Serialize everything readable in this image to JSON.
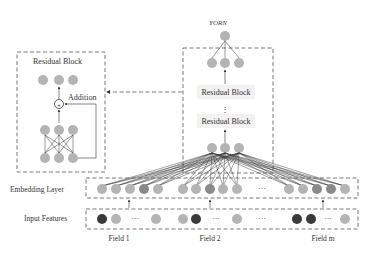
{
  "diagram": {
    "output_label": "y_ORN",
    "output_label_display": "YORN",
    "residual_detail": {
      "title": "Residual Block",
      "addition_label": "Addition",
      "addition_symbol": "+"
    },
    "main_stack": {
      "blocks": [
        "Residual Block",
        "Residual Block"
      ],
      "ellipsis": "⋮"
    },
    "layers": {
      "embedding": "Embedding Layer",
      "input": "Input Features"
    },
    "fields": [
      "Field 1",
      "Field 2",
      "Field m"
    ],
    "ellipsis": "···",
    "colors": {
      "node_light": "#b4b4b4",
      "node_medium": "#8a8a8a",
      "node_dark": "#3a3a3a",
      "border_dash": "#555555",
      "block_bg": "#f2f2f2",
      "line": "#333333"
    }
  }
}
